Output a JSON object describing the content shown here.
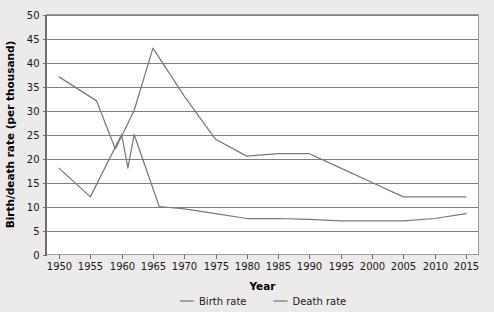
{
  "chart_data": {
    "type": "line",
    "title": "",
    "xlabel": "Year",
    "ylabel": "Birth/death rate (per thousand)",
    "xlim": [
      1948,
      2017
    ],
    "ylim": [
      0,
      50
    ],
    "grid": true,
    "legend_position": "bottom",
    "x_ticks": [
      1950,
      1955,
      1960,
      1965,
      1970,
      1975,
      1980,
      1985,
      1990,
      1995,
      2000,
      2005,
      2010,
      2015
    ],
    "y_ticks": [
      0,
      5,
      10,
      15,
      20,
      25,
      30,
      35,
      40,
      45,
      50
    ],
    "x_tick_labels": [
      "1950",
      "1955",
      "1960",
      "1965",
      "1970",
      "1975",
      "1980",
      "1985",
      "1990",
      "1995",
      "2000",
      "2005",
      "2010",
      "2015"
    ],
    "y_tick_labels": [
      "0",
      "5",
      "10",
      "15",
      "20",
      "25",
      "30",
      "35",
      "40",
      "45",
      "50"
    ],
    "series": [
      {
        "name": "Birth rate",
        "color": "#7a7a7a",
        "x": [
          1950,
          1956,
          1959,
          1962,
          1965,
          1970,
          1975,
          1980,
          1985,
          1990,
          1995,
          2000,
          2005,
          2010,
          2015
        ],
        "values": [
          37,
          32,
          22,
          30,
          43,
          33,
          24,
          20.5,
          21,
          21,
          18,
          15,
          12,
          12,
          12
        ]
      },
      {
        "name": "Death rate",
        "color": "#7a7a7a",
        "x": [
          1950,
          1955,
          1960,
          1961,
          1962,
          1966,
          1970,
          1975,
          1980,
          1985,
          1990,
          1995,
          2000,
          2005,
          2010,
          2015
        ],
        "values": [
          18,
          12,
          25,
          18,
          25,
          10,
          9.5,
          8.5,
          7.5,
          7.5,
          7.3,
          7,
          7,
          7,
          7.5,
          8.5
        ]
      }
    ]
  },
  "legend": {
    "entries": [
      {
        "label": "Birth rate"
      },
      {
        "label": "Death rate"
      }
    ]
  }
}
